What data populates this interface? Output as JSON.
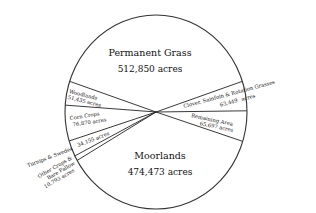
{
  "chart_data": {
    "type": "pie",
    "title": "",
    "unit": "acres",
    "slices": [
      {
        "label": "Permanent Grass",
        "value": 512850,
        "value_text": "512,850 acres"
      },
      {
        "label": "Clover, Sainfoin & Rotation Grasses",
        "value": 63449,
        "value_text": "63,449 acres"
      },
      {
        "label": "Remaining Area",
        "value": 65697,
        "value_text": "65,697 acres"
      },
      {
        "label": "Moorlands",
        "value": 474473,
        "value_text": "474,473 acres"
      },
      {
        "label": "Other Crops & Bare Fallow",
        "value": 10793,
        "value_text": "10,793 acres"
      },
      {
        "label": "Turnips & Swedes",
        "value": 34155,
        "value_text": "34,155 acres"
      },
      {
        "label": "Corn Crops",
        "value": 76870,
        "value_text": "76,870 acres"
      },
      {
        "label": "Woodlands",
        "value": 51435,
        "value_text": "51,435 acres"
      }
    ],
    "legend": "none",
    "colors": {
      "fill": "#ffffff",
      "stroke": "#222222",
      "text": "#111111"
    }
  }
}
